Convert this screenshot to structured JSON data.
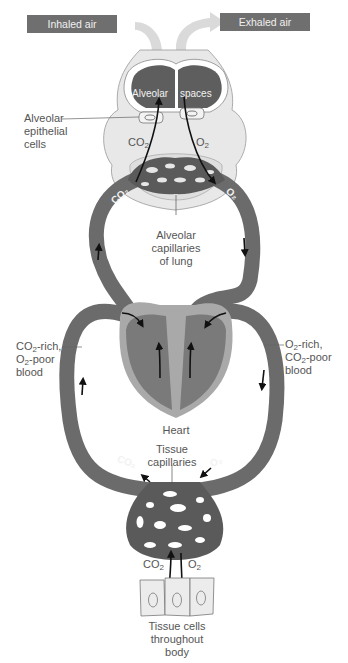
{
  "title_boxes": {
    "inhaled": "Inhaled air",
    "exhaled": "Exhaled air"
  },
  "lung": {
    "alveolar_word": "Alveolar",
    "spaces_word": "spaces",
    "epithelial_label_1": "Alveolar",
    "epithelial_label_2": "epithelial",
    "epithelial_label_3": "cells",
    "co2": "CO",
    "o2": "O",
    "sub2": "2",
    "capillaries_1": "Alveolar",
    "capillaries_2": "capillaries",
    "capillaries_3": "of lung"
  },
  "vessels": {
    "left_1a": "CO",
    "left_1b": "-rich,",
    "left_2a": "O",
    "left_2b": "-poor",
    "left_3": "blood",
    "right_1a": "O",
    "right_1b": "-rich,",
    "right_2a": "CO",
    "right_2b": "-poor",
    "right_3": "blood",
    "sub2": "2",
    "co2_tag": "CO₂",
    "o2_tag": "O₂"
  },
  "heart": {
    "label": "Heart"
  },
  "tissue": {
    "capillaries_1": "Tissue",
    "capillaries_2": "capillaries",
    "co2": "CO",
    "o2": "O",
    "sub2": "2",
    "cells_1": "Tissue cells",
    "cells_2": "throughout",
    "cells_3": "body"
  },
  "colors": {
    "vessel": "#6b6b6b",
    "vessel_dark": "#555555",
    "alveolar_space": "#5e5e5e",
    "lung_tissue": "#e6e6e6",
    "heart_outer": "#a9a9a9",
    "heart_chamber": "#7a7a7a",
    "air_arrow": "#d9d9d9",
    "label_box": "#6f6f6f"
  }
}
